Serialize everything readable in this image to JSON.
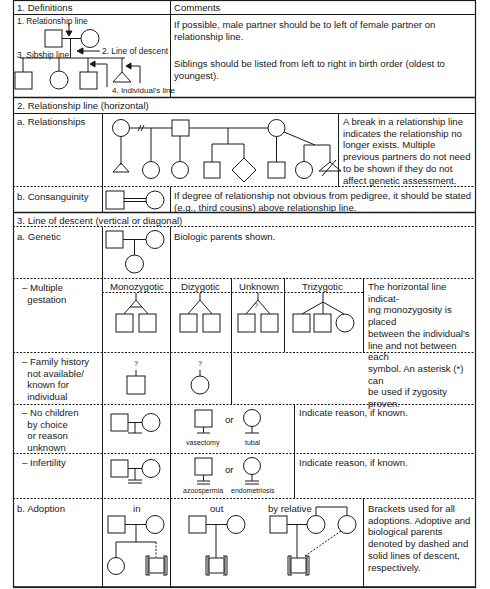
{
  "table": {
    "header": {
      "col1": "1. Definitions",
      "col2": "Comments"
    },
    "definitions": {
      "labels": {
        "relationship_line": "1. Relationship line",
        "line_of_descent": "2. Line of descent",
        "sibship_line": "3. Sibship line",
        "individuals_line": "4. Individual's line"
      },
      "comment_1": "If possible, male partner should be to left of female partner on relationship line.",
      "comment_2": "Siblings should be listed from left to right in birth order (oldest to youngest)."
    },
    "section_2": {
      "title": "2. Relationship line (horizontal)",
      "rows": [
        {
          "label": "a. Relationships",
          "comment": "A break in a relationship line indicates the relationship no longer exists. Multiple previous partners do not need to be shown if they do not affect genetic assessment."
        },
        {
          "label": "b. Consanguinity",
          "comment": "If degree of relationship not obvious from pedigree, it should be stated (e.g., third cousins) above relationship line."
        }
      ]
    },
    "section_3": {
      "title": "3. Line of descent (vertical or diagonal)",
      "rows": [
        {
          "label": "a. Genetic",
          "comment": "Biologic parents shown."
        },
        {
          "label": "– Multiple\n  gestation",
          "subheaders": [
            "Monozygotic",
            "Dizygotic",
            "Unknown",
            "Trizygotic"
          ],
          "unknown_mark": "?",
          "comment": "The horizontal line indicat-\ning monozygosity is placed\nbetween the individual's\nline and not between each\nsymbol. An asterisk (*) can\nbe used if zygosity proven."
        },
        {
          "label": "– Family history\n  not available/\n  known for\n  individual",
          "mark": "?"
        },
        {
          "label": "– No children\n  by choice\n  or reason\n  unknown",
          "symbol_labels": [
            "vasectomy",
            "or",
            "tubal"
          ],
          "comment": "Indicate reason, if known."
        },
        {
          "label": "– Infertility",
          "symbol_labels": [
            "azoospermia",
            "or",
            "endometriosis"
          ],
          "comment": "Indicate reason, if known."
        },
        {
          "label": "b. Adoption",
          "subheaders": [
            "in",
            "out",
            "by relative"
          ],
          "comment": "Brackets used for all adoptions. Adoptive and biological parents denoted by dashed and solid lines of descent, respectively."
        }
      ]
    }
  },
  "colors": {
    "line": "#1a1a1a",
    "background": "#ffffff"
  }
}
